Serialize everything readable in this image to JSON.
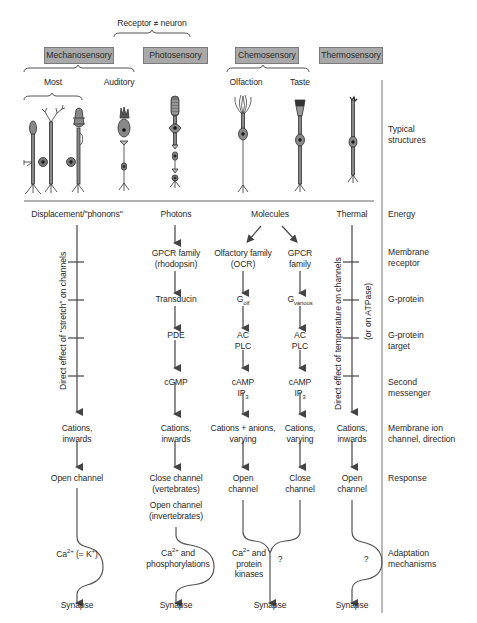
{
  "header": {
    "receptor_note": "Receptor ≠ neuron"
  },
  "categories": [
    {
      "label": "Mechanosensory",
      "subgroups": [
        "Most",
        "Auditory"
      ]
    },
    {
      "label": "Photosensory"
    },
    {
      "label": "Chemosensory",
      "subgroups": [
        "Olfaction",
        "Taste"
      ]
    },
    {
      "label": "Thermosensory"
    }
  ],
  "row_labels": {
    "structures": [
      "Typical",
      "structures"
    ],
    "energy": "Energy",
    "receptor": [
      "Membrane",
      "receptor"
    ],
    "gprotein": "G-protein",
    "gtarget": [
      "G-protein",
      "target"
    ],
    "second": [
      "Second",
      "messenger"
    ],
    "channel": [
      "Membrane ion",
      "channel, direction"
    ],
    "response": "Response",
    "adaptation": [
      "Adaptation",
      "mechanisms"
    ]
  },
  "mechano": {
    "energy": "Displacement/\"phonons\"",
    "vertical_note": "Direct effect of \"stretch\" on channels",
    "channel": [
      "Cations,",
      "inwards"
    ],
    "response": "Open channel",
    "adaptation_main": "Ca",
    "adaptation_sup": "2+",
    "adaptation_rest": " (= K",
    "adaptation_sup2": "+",
    "adaptation_end": ")",
    "output": "Synapse"
  },
  "photo": {
    "energy": "Photons",
    "receptor": [
      "GPCR family",
      "(rhodopsin)"
    ],
    "gprotein": "Transducin",
    "gtarget": "PDE",
    "second": "cGMP",
    "channel": [
      "Cations,",
      "inwards"
    ],
    "response": [
      "Close channel",
      "(vertebrates)"
    ],
    "response2": [
      "Open channel",
      "(invertebrates)"
    ],
    "adaptation_ca": "Ca",
    "adaptation_sup": "2+",
    "adaptation_rest": " and",
    "adaptation_line2": "phosphorylations",
    "output": "Synapse"
  },
  "chemo": {
    "energy": "Molecules",
    "olf": {
      "receptor": [
        "Olfactory family",
        "(OCR)"
      ],
      "gprotein_main": "G",
      "gprotein_sub": "olf",
      "gtarget": [
        "AC",
        "PLC"
      ],
      "second": [
        "cAMP",
        "IP"
      ],
      "second_sub": "3",
      "channel": [
        "Cations + anions,",
        "varying"
      ],
      "response": [
        "Open",
        "channel"
      ]
    },
    "taste": {
      "receptor": [
        "GPCR",
        "family"
      ],
      "gprotein_main": "G",
      "gprotein_sub": "various",
      "gtarget": [
        "AC",
        "PLC"
      ],
      "second": [
        "cAMP",
        "IP"
      ],
      "second_sub": "3",
      "channel": [
        "Cations,",
        "varying"
      ],
      "response": [
        "Close",
        "channel"
      ]
    },
    "adaptation_ca": "Ca",
    "adaptation_sup": "2+",
    "adaptation_rest": " and",
    "adaptation_line2": "protein",
    "adaptation_line3": "kinases",
    "question": "?",
    "output": "Synapse"
  },
  "thermo": {
    "energy": "Thermal",
    "vertical_note": "Direct effect of temperature on channels",
    "vertical_note2": "(or on ATPase)",
    "channel": [
      "Cations,",
      "inwards"
    ],
    "response": [
      "Open",
      "channel"
    ],
    "question": "?",
    "output": "Synapse"
  }
}
